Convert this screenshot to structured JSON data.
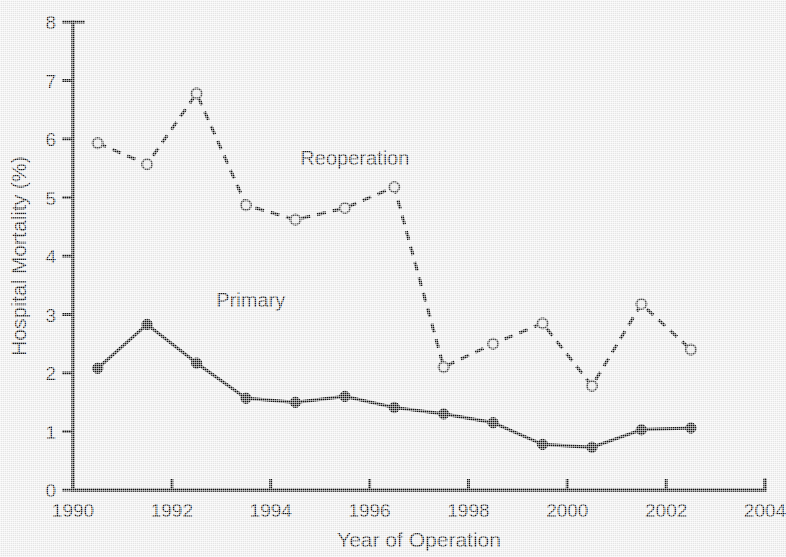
{
  "chart_data": {
    "type": "line",
    "title": "",
    "xlabel": "Year of Operation",
    "ylabel": "Hospital Mortality (%)",
    "xlim": [
      1990,
      2004
    ],
    "ylim": [
      0,
      8
    ],
    "grid": false,
    "legend": "inline-annotations",
    "x_ticks": [
      "1990",
      "1992",
      "1994",
      "1996",
      "1998",
      "2000",
      "2002",
      "2004"
    ],
    "x_tick_values": [
      1990,
      1992,
      1994,
      1996,
      1998,
      2000,
      2002,
      2004
    ],
    "x_minor_tick_values": [
      1991,
      1993,
      1995,
      1997,
      1999,
      2001,
      2003
    ],
    "y_ticks": [
      "0",
      "1",
      "2",
      "3",
      "4",
      "5",
      "6",
      "7",
      "8"
    ],
    "y_tick_values": [
      0,
      1,
      2,
      3,
      4,
      5,
      6,
      7,
      8
    ],
    "x": [
      1990.5,
      1991.5,
      1992.5,
      1993.5,
      1994.5,
      1995.5,
      1996.5,
      1997.5,
      1998.5,
      1999.5,
      2000.5,
      2001.5,
      2002.5
    ],
    "series": [
      {
        "name": "Primary",
        "style": "solid",
        "marker": "filled-circle",
        "color": "#111111",
        "label_x": 1992.9,
        "label_y": 3.12,
        "values": [
          2.08,
          2.83,
          2.17,
          1.57,
          1.5,
          1.6,
          1.41,
          1.3,
          1.15,
          0.78,
          0.73,
          1.03,
          1.06
        ]
      },
      {
        "name": "Reoperation",
        "style": "dashed",
        "marker": "open-circle",
        "color": "#111111",
        "label_x": 1994.6,
        "label_y": 5.55,
        "values": [
          5.93,
          5.57,
          6.78,
          4.87,
          4.62,
          4.82,
          5.18,
          2.1,
          2.5,
          2.85,
          1.78,
          3.18,
          2.4
        ]
      }
    ]
  },
  "figure": {
    "background_color": "#eeeeee",
    "ink_color": "#111111"
  }
}
